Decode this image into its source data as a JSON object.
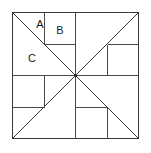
{
  "figure": {
    "kind": "geometric-diagram",
    "canvas": {
      "width": 151,
      "height": 153,
      "background": "#ffffff"
    },
    "square": {
      "name": "outer-square",
      "left": 12,
      "top": 12,
      "right": 138,
      "bottom": 138,
      "side": 126
    },
    "center": {
      "x": 75,
      "y": 75
    },
    "style": {
      "stroke": "#4a4a4a",
      "stroke_dark": "#3a3a3a",
      "stroke_width": 1,
      "label_color": "#1a1a1a",
      "label_font_size": 11
    },
    "diagonals": [
      {
        "name": "diagonal-tl-br",
        "x1": 12,
        "y1": 12,
        "x2": 138,
        "y2": 138
      },
      {
        "name": "diagonal-tr-bl",
        "x1": 138,
        "y1": 12,
        "x2": 12,
        "y2": 138
      }
    ],
    "segments": [
      {
        "name": "top-divider-A-B",
        "x1": 44,
        "y1": 12,
        "x2": 44,
        "y2": 44
      },
      {
        "name": "box-B-bottom",
        "x1": 44,
        "y1": 44,
        "x2": 75,
        "y2": 44
      },
      {
        "name": "top-center-vertical",
        "x1": 75,
        "y1": 12,
        "x2": 75,
        "y2": 75
      },
      {
        "name": "right-upper-horizontal",
        "x1": 107,
        "y1": 44,
        "x2": 138,
        "y2": 44
      },
      {
        "name": "right-middle-vertical",
        "x1": 107,
        "y1": 44,
        "x2": 107,
        "y2": 75
      },
      {
        "name": "center-right-horizontal",
        "x1": 75,
        "y1": 75,
        "x2": 138,
        "y2": 75
      },
      {
        "name": "left-middle-horizontal",
        "x1": 12,
        "y1": 75,
        "x2": 75,
        "y2": 75
      },
      {
        "name": "left-lower-vertical",
        "x1": 44,
        "y1": 75,
        "x2": 44,
        "y2": 107
      },
      {
        "name": "left-lower-horizontal",
        "x1": 12,
        "y1": 107,
        "x2": 44,
        "y2": 107
      },
      {
        "name": "bottom-center-vertical",
        "x1": 75,
        "y1": 75,
        "x2": 75,
        "y2": 138
      },
      {
        "name": "bottom-center-horizontal",
        "x1": 75,
        "y1": 107,
        "x2": 107,
        "y2": 107
      },
      {
        "name": "bottom-right-vertical",
        "x1": 107,
        "y1": 107,
        "x2": 107,
        "y2": 138
      }
    ],
    "labels": [
      {
        "name": "label-A",
        "text": "A",
        "x": 40,
        "y": 25
      },
      {
        "name": "label-B",
        "text": "B",
        "x": 60,
        "y": 31
      },
      {
        "name": "label-C",
        "text": "C",
        "x": 32,
        "y": 59
      }
    ]
  }
}
